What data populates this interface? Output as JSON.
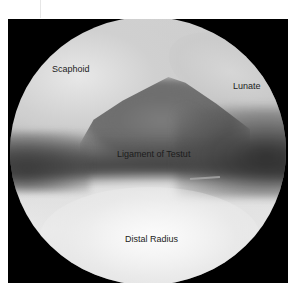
{
  "image": {
    "type": "arthroscopic-view",
    "frame_color": "#000000",
    "background_color": "#ffffff",
    "labels": {
      "scaphoid": "Scaphoid",
      "lunate": "Lunate",
      "ligament": "Ligament of Testut",
      "distal_radius": "Distal Radius"
    },
    "label_color": "#1c1c1c"
  }
}
